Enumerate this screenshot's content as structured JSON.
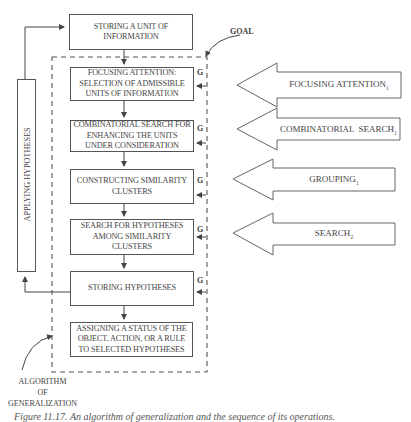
{
  "diagram": {
    "top_box": {
      "label": "STORING A UNIT OF INFORMATION"
    },
    "steps": [
      {
        "label": "FOCUSING ATTENTION: SELECTION OF ADMISSIBLE UNITS OF INFORMATION",
        "goal_marker": "G"
      },
      {
        "label": "COMBINATORIAL SEARCH FOR ENHANCING THE UNITS UNDER CONSIDERATION",
        "goal_marker": "G"
      },
      {
        "label": "CONSTRUCTING SIMILARITY CLUSTERS",
        "goal_marker": "G"
      },
      {
        "label": "SEARCH FOR HYPOTHESES AMONG SIMILARITY CLUSTERS",
        "goal_marker": "G"
      },
      {
        "label": "STORING HYPOTHESES",
        "goal_marker": "G"
      },
      {
        "label": "ASSIGNING A STATUS OF THE OBJECT, ACTION, OR A RULE TO SELECTED HYPOTHESES"
      }
    ],
    "feedback_box": {
      "label": "APPLYING HYPOTHESES"
    },
    "goal_label": "GOAL",
    "algorithm_label": {
      "line1": "ALGORITHM",
      "line2": "OF",
      "line3": "GENERALIZATION"
    },
    "operations": [
      {
        "name": "FOCUSING ATTENTION",
        "subscript": "1"
      },
      {
        "name": "COMBINATORIAL  SEARCH",
        "subscript": "1"
      },
      {
        "name": "GROUPING",
        "subscript": "1"
      },
      {
        "name": "SEARCH",
        "subscript": "2"
      }
    ],
    "caption": "Figure 11.17.  An algorithm of generalization and the sequence of its operations."
  }
}
